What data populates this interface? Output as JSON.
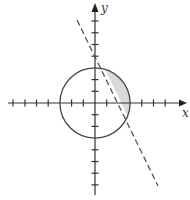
{
  "diagram": {
    "title": "",
    "axes": {
      "x_label": "x",
      "y_label": "y",
      "x_range": [
        -7,
        7.8
      ],
      "y_range": [
        -7.9,
        8.5
      ],
      "tick_spacing": 1
    },
    "circle": {
      "equation": "x^2 + y^2 = 9",
      "center": [
        0,
        0
      ],
      "radius": 3
    },
    "line": {
      "equation": "y = -2x + 4",
      "style": "dashed",
      "from": [
        -1.55,
        7.1
      ],
      "to": [
        5.4,
        -7.1
      ]
    },
    "shaded_region": "inside circle, above/right of dashed line (x^2+y^2 < 9 and y > -2x + 4)",
    "colors": {
      "axis": "#333333",
      "circle": "#444444",
      "line": "#555555",
      "shade": "#d9d9d9"
    }
  }
}
